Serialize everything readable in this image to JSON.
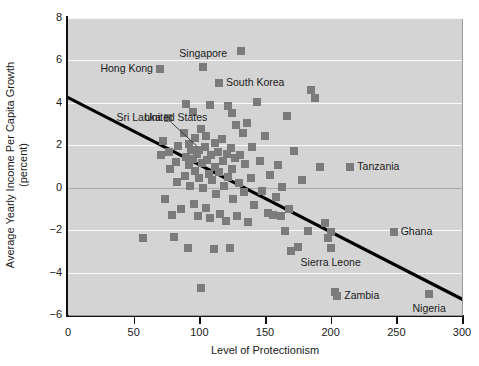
{
  "chart_data": {
    "type": "scatter",
    "title": "",
    "xlabel": "Level of Protectionism",
    "ylabel": "Average Yearly Income Per Capita Growth",
    "ylabel_line2": "(percent)",
    "xlim": [
      0,
      300
    ],
    "ylim": [
      -6,
      8
    ],
    "xticks": [
      0,
      50,
      100,
      150,
      200,
      250,
      300
    ],
    "yticks": [
      -6,
      -4,
      -2,
      0,
      2,
      4,
      6,
      8
    ],
    "grid": "horizontal-white-bands",
    "legend": "none",
    "marker_color": "#7b7b7b",
    "plot_bg_color": "#d4d4d4",
    "gridline_color": "#fbfbfb",
    "zero_line_color": "#a9a9a9",
    "trendline": {
      "label": "fitted regression line",
      "color": "#000000",
      "x": [
        0,
        300
      ],
      "y": [
        4.25,
        -5.25
      ]
    },
    "points": [
      {
        "x": 57,
        "y": -2.35
      },
      {
        "x": 70,
        "y": 5.6,
        "label": "Hong Kong",
        "label_side": "left"
      },
      {
        "x": 71,
        "y": 1.55
      },
      {
        "x": 72,
        "y": 2.2
      },
      {
        "x": 74,
        "y": -0.55
      },
      {
        "x": 76,
        "y": 3.3,
        "label": "Sri Lanka",
        "label_side": "left"
      },
      {
        "x": 77,
        "y": 1.7
      },
      {
        "x": 78,
        "y": 0.9
      },
      {
        "x": 79,
        "y": -1.3
      },
      {
        "x": 81,
        "y": -2.3
      },
      {
        "x": 82,
        "y": 1.2
      },
      {
        "x": 83,
        "y": 0.25
      },
      {
        "x": 84,
        "y": 1.95
      },
      {
        "x": 86,
        "y": -1.0
      },
      {
        "x": 88,
        "y": 2.6
      },
      {
        "x": 89,
        "y": 0.55
      },
      {
        "x": 90,
        "y": 1.45
      },
      {
        "x": 90,
        "y": 3.95
      },
      {
        "x": 91,
        "y": -2.85
      },
      {
        "x": 92,
        "y": 1.05
      },
      {
        "x": 92,
        "y": 2.05
      },
      {
        "x": 93,
        "y": 0.1
      },
      {
        "x": 94,
        "y": 1.8
      },
      {
        "x": 95,
        "y": 3.55
      },
      {
        "x": 95,
        "y": 1.35
      },
      {
        "x": 96,
        "y": -0.75
      },
      {
        "x": 97,
        "y": 2.35
      },
      {
        "x": 97,
        "y": 0.8
      },
      {
        "x": 98,
        "y": 1.6
      },
      {
        "x": 99,
        "y": -1.35
      },
      {
        "x": 100,
        "y": 1.8,
        "label": "United States",
        "label_side": "leader"
      },
      {
        "x": 100,
        "y": 0.45
      },
      {
        "x": 101,
        "y": 2.75
      },
      {
        "x": 101,
        "y": -4.75
      },
      {
        "x": 102,
        "y": 1.15
      },
      {
        "x": 103,
        "y": 5.7,
        "label": "Singapore",
        "label_side": "above"
      },
      {
        "x": 103,
        "y": 0.0
      },
      {
        "x": 104,
        "y": 1.9
      },
      {
        "x": 105,
        "y": -0.95
      },
      {
        "x": 105,
        "y": 2.45
      },
      {
        "x": 106,
        "y": 1.3
      },
      {
        "x": 107,
        "y": 0.65
      },
      {
        "x": 108,
        "y": -1.45
      },
      {
        "x": 108,
        "y": 3.9
      },
      {
        "x": 109,
        "y": 1.55
      },
      {
        "x": 110,
        "y": 0.35
      },
      {
        "x": 111,
        "y": -2.9
      },
      {
        "x": 112,
        "y": 2.1
      },
      {
        "x": 112,
        "y": 1.0
      },
      {
        "x": 113,
        "y": -0.3
      },
      {
        "x": 114,
        "y": 1.7
      },
      {
        "x": 115,
        "y": 4.95,
        "label": "South Korea",
        "label_side": "right"
      },
      {
        "x": 115,
        "y": 0.75
      },
      {
        "x": 116,
        "y": -1.25
      },
      {
        "x": 117,
        "y": 2.3
      },
      {
        "x": 118,
        "y": 1.25
      },
      {
        "x": 119,
        "y": 0.1
      },
      {
        "x": 120,
        "y": -1.55
      },
      {
        "x": 121,
        "y": 1.6
      },
      {
        "x": 122,
        "y": 3.85
      },
      {
        "x": 122,
        "y": 0.5
      },
      {
        "x": 123,
        "y": -2.85
      },
      {
        "x": 124,
        "y": 1.85
      },
      {
        "x": 125,
        "y": 3.5
      },
      {
        "x": 125,
        "y": 0.9
      },
      {
        "x": 126,
        "y": -0.55
      },
      {
        "x": 127,
        "y": 1.4
      },
      {
        "x": 128,
        "y": 2.95
      },
      {
        "x": 129,
        "y": -1.35
      },
      {
        "x": 130,
        "y": 0.2
      },
      {
        "x": 131,
        "y": 1.55
      },
      {
        "x": 132,
        "y": 6.45
      },
      {
        "x": 133,
        "y": 2.6
      },
      {
        "x": 134,
        "y": -0.2
      },
      {
        "x": 135,
        "y": 1.1
      },
      {
        "x": 136,
        "y": 3.05
      },
      {
        "x": 137,
        "y": -1.6
      },
      {
        "x": 139,
        "y": 0.45
      },
      {
        "x": 140,
        "y": 1.9
      },
      {
        "x": 142,
        "y": -0.8
      },
      {
        "x": 144,
        "y": 4.05
      },
      {
        "x": 146,
        "y": 1.25
      },
      {
        "x": 148,
        "y": -0.15
      },
      {
        "x": 150,
        "y": 2.45
      },
      {
        "x": 152,
        "y": -1.2
      },
      {
        "x": 154,
        "y": 0.6
      },
      {
        "x": 156,
        "y": -1.3
      },
      {
        "x": 158,
        "y": -0.45
      },
      {
        "x": 160,
        "y": 1.05
      },
      {
        "x": 162,
        "y": -1.35
      },
      {
        "x": 163,
        "y": 0.05
      },
      {
        "x": 165,
        "y": -2.05
      },
      {
        "x": 167,
        "y": 3.4
      },
      {
        "x": 168,
        "y": -1.0
      },
      {
        "x": 170,
        "y": -3.0
      },
      {
        "x": 172,
        "y": 1.75
      },
      {
        "x": 175,
        "y": -2.8
      },
      {
        "x": 178,
        "y": 0.35
      },
      {
        "x": 183,
        "y": -2.05
      },
      {
        "x": 185,
        "y": 4.6
      },
      {
        "x": 188,
        "y": 4.25
      },
      {
        "x": 192,
        "y": 1.0
      },
      {
        "x": 196,
        "y": -1.65
      },
      {
        "x": 198,
        "y": -2.35
      },
      {
        "x": 200,
        "y": -2.85,
        "label": "Sierra Leone",
        "label_side": "below"
      },
      {
        "x": 200,
        "y": -2.1
      },
      {
        "x": 203,
        "y": -4.9
      },
      {
        "x": 205,
        "y": -5.1,
        "label": "Zambia",
        "label_side": "right"
      },
      {
        "x": 215,
        "y": 1.0,
        "label": "Tanzania",
        "label_side": "right"
      },
      {
        "x": 248,
        "y": -2.1,
        "label": "Ghana",
        "label_side": "right"
      },
      {
        "x": 275,
        "y": -5.0,
        "label": "Nigeria",
        "label_side": "below"
      }
    ]
  }
}
